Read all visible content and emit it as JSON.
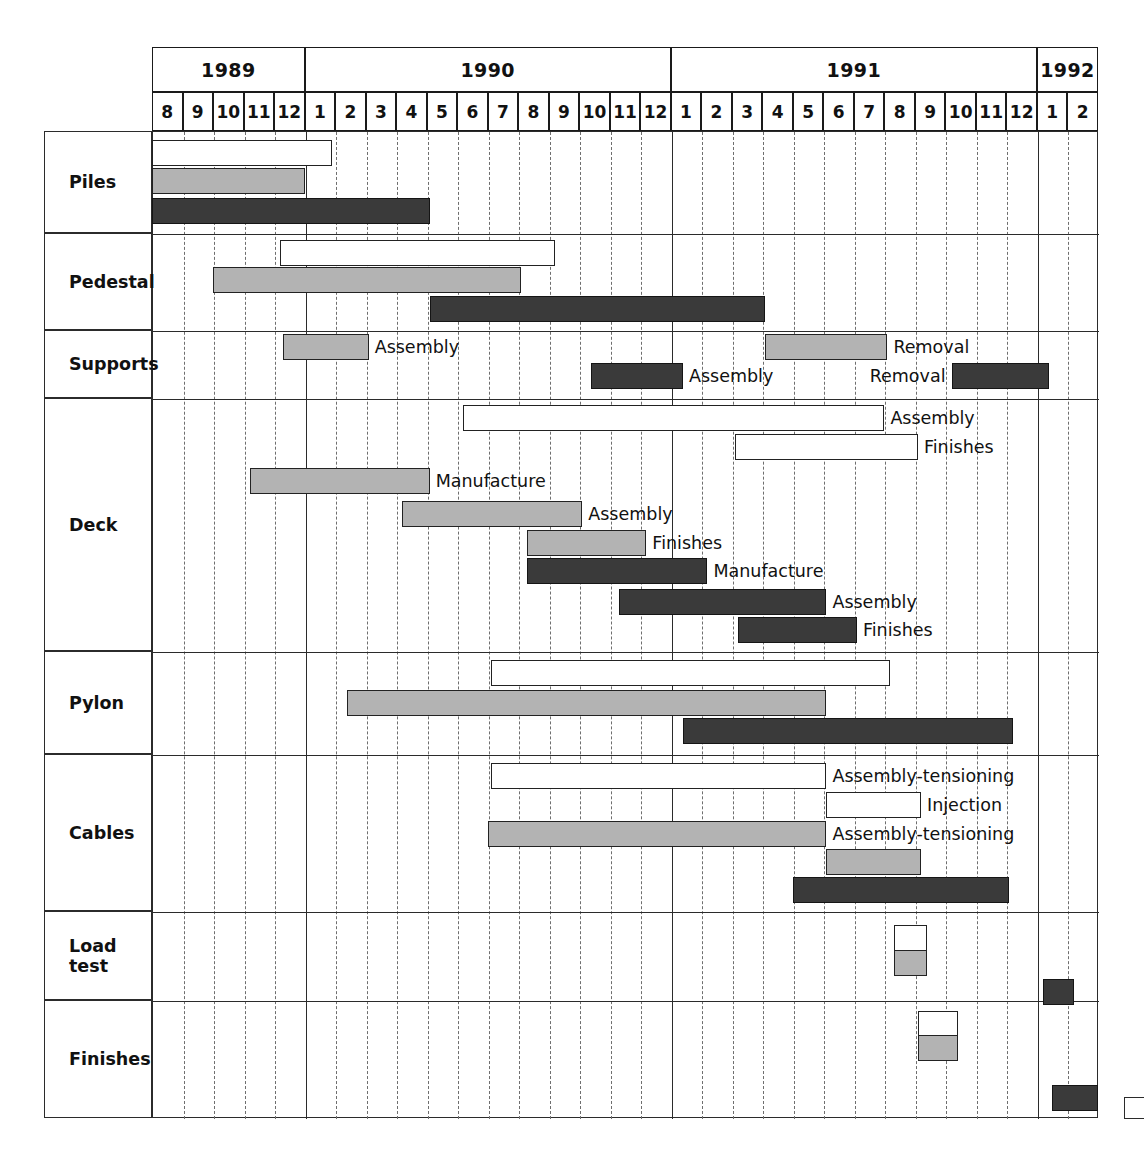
{
  "chart_data": {
    "type": "bar",
    "subtype": "gantt",
    "title": "",
    "xlabel": "",
    "ylabel": "",
    "grid": true,
    "legend_position": "none",
    "time_axis": {
      "unit": "month",
      "start": "1989-08",
      "end": "1992-02",
      "total_months": 31,
      "years": [
        {
          "label": "1989",
          "start_month_index": 0,
          "span": 5
        },
        {
          "label": "1990",
          "start_month_index": 5,
          "span": 12
        },
        {
          "label": "1991",
          "start_month_index": 17,
          "span": 12
        },
        {
          "label": "1992",
          "start_month_index": 29,
          "span": 2
        }
      ],
      "month_ticks": [
        "8",
        "9",
        "10",
        "11",
        "12",
        "1",
        "2",
        "3",
        "4",
        "5",
        "6",
        "7",
        "8",
        "9",
        "10",
        "11",
        "12",
        "1",
        "2",
        "3",
        "4",
        "5",
        "6",
        "7",
        "8",
        "9",
        "10",
        "11",
        "12",
        "1",
        "2"
      ]
    },
    "colors": {
      "white_bar": "#ffffff",
      "gray_bar": "#b3b3b3",
      "dark_bar": "#3a3a3a",
      "outline": "#222222",
      "grid_solid": "#2b2b2b",
      "grid_dashed": "#6e6e6e"
    },
    "categories": [
      "Piles",
      "Pedestal",
      "Supports",
      "Deck",
      "Pylon",
      "Cables",
      "Load test",
      "Finishes"
    ],
    "rows": [
      {
        "label": "Piles",
        "bars": [
          {
            "style": "white",
            "start": 0.0,
            "end": 5.9,
            "label": ""
          },
          {
            "style": "gray",
            "start": 0.0,
            "end": 5.0,
            "label": ""
          },
          {
            "style": "dark",
            "start": 0.0,
            "end": 9.1,
            "label": ""
          }
        ]
      },
      {
        "label": "Pedestal",
        "bars": [
          {
            "style": "white",
            "start": 4.2,
            "end": 13.2,
            "label": ""
          },
          {
            "style": "gray",
            "start": 2.0,
            "end": 12.1,
            "label": ""
          },
          {
            "style": "dark",
            "start": 9.1,
            "end": 20.1,
            "label": ""
          }
        ]
      },
      {
        "label": "Supports",
        "bars": [
          {
            "style": "gray",
            "start": 4.3,
            "end": 7.1,
            "label": "Assembly"
          },
          {
            "style": "gray",
            "start": 20.1,
            "end": 24.1,
            "label": "Removal"
          },
          {
            "style": "dark",
            "start": 14.4,
            "end": 17.4,
            "label": "Assembly"
          },
          {
            "style": "dark",
            "start": 26.2,
            "end": 29.4,
            "label": "Removal"
          }
        ]
      },
      {
        "label": "Deck",
        "bars": [
          {
            "style": "white",
            "start": 10.2,
            "end": 24.0,
            "label": "Assembly"
          },
          {
            "style": "white",
            "start": 19.1,
            "end": 25.1,
            "label": "Finishes"
          },
          {
            "style": "gray",
            "start": 3.2,
            "end": 9.1,
            "label": "Manufacture"
          },
          {
            "style": "gray",
            "start": 8.2,
            "end": 14.1,
            "label": "Assembly"
          },
          {
            "style": "gray",
            "start": 12.3,
            "end": 16.2,
            "label": "Finishes"
          },
          {
            "style": "dark",
            "start": 12.3,
            "end": 18.2,
            "label": "Manufacture"
          },
          {
            "style": "dark",
            "start": 15.3,
            "end": 22.1,
            "label": "Assembly"
          },
          {
            "style": "dark",
            "start": 19.2,
            "end": 23.1,
            "label": "Finishes"
          }
        ]
      },
      {
        "label": "Pylon",
        "bars": [
          {
            "style": "white",
            "start": 11.1,
            "end": 24.2,
            "label": ""
          },
          {
            "style": "gray",
            "start": 6.4,
            "end": 22.1,
            "label": ""
          },
          {
            "style": "dark",
            "start": 17.4,
            "end": 28.2,
            "label": ""
          }
        ]
      },
      {
        "label": "Cables",
        "bars": [
          {
            "style": "white",
            "start": 11.1,
            "end": 22.1,
            "label": "Assembly-tensioning"
          },
          {
            "style": "white",
            "start": 22.1,
            "end": 25.2,
            "label": "Injection"
          },
          {
            "style": "gray",
            "start": 11.0,
            "end": 22.1,
            "label": "Assembly-tensioning"
          },
          {
            "style": "gray",
            "start": 22.1,
            "end": 25.2,
            "label": ""
          },
          {
            "style": "dark",
            "start": 21.0,
            "end": 28.1,
            "label": ""
          }
        ]
      },
      {
        "label": "Load test",
        "bars": [
          {
            "style": "white",
            "start": 24.3,
            "end": 25.4,
            "label": ""
          },
          {
            "style": "gray",
            "start": 24.3,
            "end": 25.4,
            "label": ""
          },
          {
            "style": "dark",
            "start": 29.2,
            "end": 30.2,
            "label": ""
          }
        ]
      },
      {
        "label": "Finishes",
        "bars": [
          {
            "style": "white",
            "start": 25.1,
            "end": 26.4,
            "label": ""
          },
          {
            "style": "gray",
            "start": 25.1,
            "end": 26.4,
            "label": ""
          },
          {
            "style": "dark",
            "start": 29.5,
            "end": 31.0,
            "label": ""
          }
        ]
      }
    ]
  }
}
